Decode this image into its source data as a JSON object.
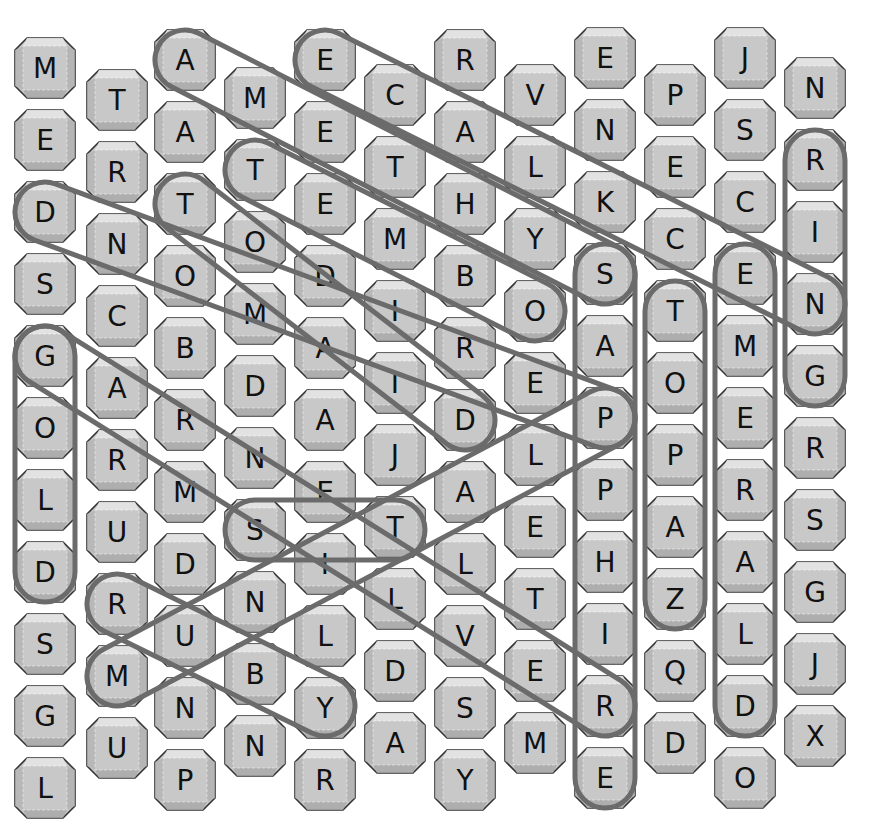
{
  "puzzle": {
    "type": "word-search",
    "layout": "offset-columns",
    "columns": [
      {
        "x": 45,
        "y0": 68,
        "letters": [
          "M",
          "E",
          "D",
          "S",
          "G",
          "O",
          "L",
          "D",
          "S",
          "G",
          "L"
        ]
      },
      {
        "x": 117,
        "y0": 100,
        "letters": [
          "T",
          "R",
          "N",
          "C",
          "A",
          "R",
          "U",
          "R",
          "M",
          "U"
        ]
      },
      {
        "x": 185,
        "y0": 60,
        "letters": [
          "A",
          "A",
          "T",
          "O",
          "B",
          "R",
          "M",
          "D",
          "U",
          "N",
          "P"
        ]
      },
      {
        "x": 255,
        "y0": 98,
        "letters": [
          "M",
          "T",
          "O",
          "M",
          "D",
          "N",
          "S",
          "N",
          "B",
          "N"
        ]
      },
      {
        "x": 325,
        "y0": 60,
        "letters": [
          "E",
          "E",
          "E",
          "D",
          "A",
          "A",
          "E",
          "I",
          "L",
          "Y",
          "R"
        ]
      },
      {
        "x": 395,
        "y0": 95,
        "letters": [
          "C",
          "T",
          "M",
          "I",
          "I",
          "J",
          "T",
          "L",
          "D",
          "A"
        ]
      },
      {
        "x": 465,
        "y0": 60,
        "letters": [
          "R",
          "A",
          "H",
          "B",
          "R",
          "D",
          "A",
          "L",
          "V",
          "S",
          "Y"
        ]
      },
      {
        "x": 535,
        "y0": 95,
        "letters": [
          "V",
          "L",
          "Y",
          "O",
          "E",
          "L",
          "E",
          "T",
          "E",
          "M"
        ]
      },
      {
        "x": 605,
        "y0": 58,
        "letters": [
          "E",
          "N",
          "K",
          "S",
          "A",
          "P",
          "P",
          "H",
          "I",
          "R",
          "E"
        ]
      },
      {
        "x": 675,
        "y0": 95,
        "letters": [
          "P",
          "E",
          "C",
          "T",
          "O",
          "P",
          "A",
          "Z",
          "Q",
          "D"
        ]
      },
      {
        "x": 745,
        "y0": 58,
        "letters": [
          "J",
          "S",
          "C",
          "E",
          "M",
          "E",
          "R",
          "A",
          "L",
          "D",
          "O"
        ]
      },
      {
        "x": 815,
        "y0": 88,
        "letters": [
          "N",
          "R",
          "I",
          "N",
          "G",
          "R",
          "S",
          "G",
          "J",
          "X"
        ]
      }
    ],
    "row_step": 72,
    "found_words": [
      {
        "word": "RING",
        "x1": 815,
        "y1": 160,
        "x2": 815,
        "y2": 376
      },
      {
        "word": "EMERALD",
        "x1": 745,
        "y1": 274,
        "x2": 745,
        "y2": 706
      },
      {
        "word": "TOPAZ",
        "x1": 675,
        "y1": 311,
        "x2": 675,
        "y2": 599
      },
      {
        "word": "SAPPHIRE",
        "x1": 605,
        "y1": 274,
        "x2": 605,
        "y2": 778
      },
      {
        "word": "GOLD",
        "x1": 45,
        "y1": 356,
        "x2": 45,
        "y2": 572
      },
      {
        "word": "AMETHYST",
        "x1": 185,
        "y1": 60,
        "x2": 605,
        "y2": 274
      },
      {
        "word": "ECKLACE",
        "x1": 325,
        "y1": 60,
        "x2": 815,
        "y2": 304
      },
      {
        "word": "TEMBO",
        "x1": 255,
        "y1": 170,
        "x2": 535,
        "y2": 311
      },
      {
        "word": "TOMAIRD",
        "x1": 185,
        "y1": 204,
        "x2": 465,
        "y2": 420
      },
      {
        "word": "DIAMOND",
        "x1": 45,
        "y1": 212,
        "x2": 605,
        "y2": 418
      },
      {
        "word": "GARNET",
        "x1": 45,
        "y1": 356,
        "x2": 605,
        "y2": 706
      },
      {
        "word": "ST",
        "x1": 255,
        "y1": 530,
        "x2": 395,
        "y2": 530
      },
      {
        "word": "RUBY",
        "x1": 117,
        "y1": 604,
        "x2": 325,
        "y2": 706
      },
      {
        "word": "MUNLTEP",
        "x1": 117,
        "y1": 676,
        "x2": 605,
        "y2": 418
      }
    ],
    "colors": {
      "tile_fill": "#c8c8c8",
      "tile_top": "#e4e4e4",
      "tile_edge": "#333333",
      "oval_stroke": "#6b6b6b",
      "letter": "#111111",
      "background": "#ffffff"
    }
  }
}
